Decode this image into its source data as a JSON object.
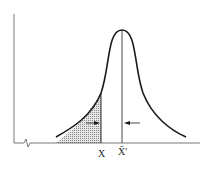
{
  "figure": {
    "type": "bell-curve-tail-diagram",
    "labels": {
      "x_marker": "X",
      "mean_marker": "X̄'"
    },
    "colors": {
      "curve": "#1a1a1a",
      "axis": "#555555",
      "shading": "#bdbdbd"
    }
  }
}
